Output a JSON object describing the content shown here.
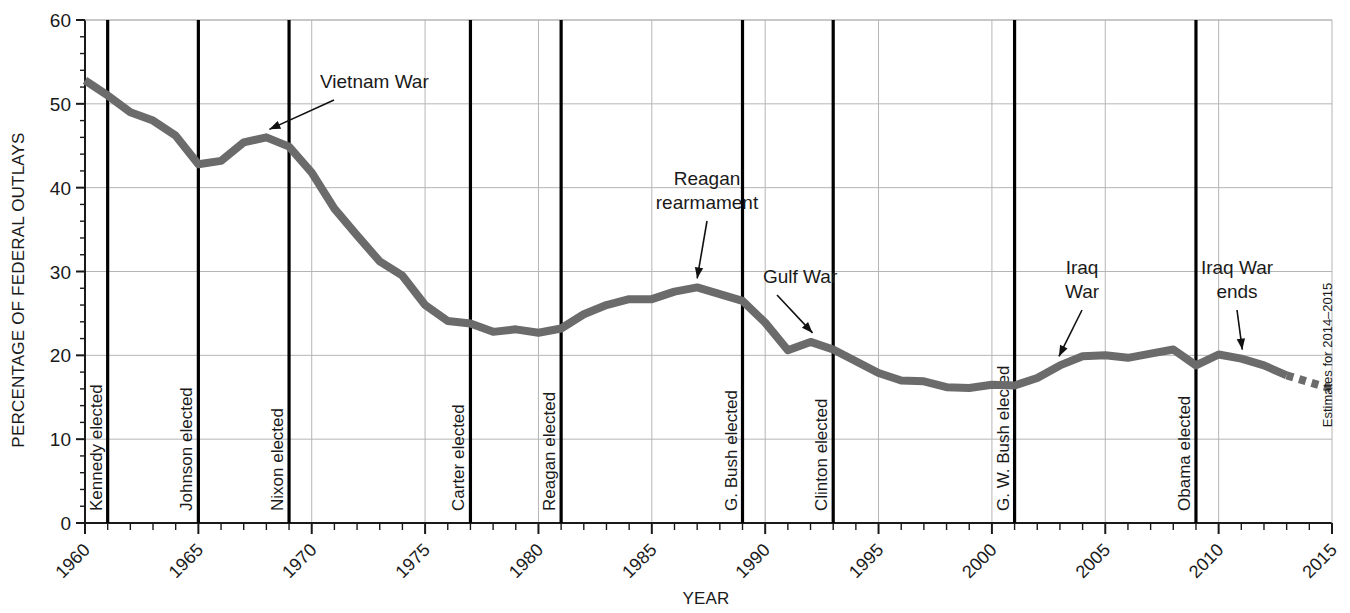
{
  "chart_data": {
    "type": "line",
    "title": "",
    "xlabel": "YEAR",
    "ylabel": "PERCENTAGE OF FEDERAL OUTLAYS",
    "xlim": [
      1960,
      2015
    ],
    "ylim": [
      0,
      60
    ],
    "y_ticks": [
      0,
      10,
      20,
      30,
      40,
      50,
      60
    ],
    "y_minor_tick_step": 2,
    "x_ticks": [
      1960,
      1965,
      1970,
      1975,
      1980,
      1985,
      1990,
      1995,
      2000,
      2005,
      2010,
      2015
    ],
    "x_minor_tick_step": 1,
    "grid": "horizontal major + vertical at labeled years",
    "legend": "none",
    "series": [
      {
        "name": "Defense share of federal outlays",
        "color": "#6b6b6b",
        "x": [
          1960,
          1961,
          1962,
          1963,
          1964,
          1965,
          1966,
          1967,
          1968,
          1969,
          1970,
          1971,
          1972,
          1973,
          1974,
          1975,
          1976,
          1977,
          1978,
          1979,
          1980,
          1981,
          1982,
          1983,
          1984,
          1985,
          1986,
          1987,
          1988,
          1989,
          1990,
          1991,
          1992,
          1993,
          1994,
          1995,
          1996,
          1997,
          1998,
          1999,
          2000,
          2001,
          2002,
          2003,
          2004,
          2005,
          2006,
          2007,
          2008,
          2009,
          2010,
          2011,
          2012,
          2013
        ],
        "values": [
          52.8,
          51.0,
          49.0,
          48.0,
          46.2,
          42.8,
          43.2,
          45.4,
          46.0,
          44.9,
          41.8,
          37.5,
          34.3,
          31.2,
          29.5,
          26.0,
          24.1,
          23.8,
          22.8,
          23.1,
          22.7,
          23.2,
          24.9,
          26.0,
          26.7,
          26.7,
          27.6,
          28.1,
          27.3,
          26.5,
          23.9,
          20.6,
          21.6,
          20.7,
          19.3,
          17.9,
          17.0,
          16.9,
          16.2,
          16.1,
          16.5,
          16.4,
          17.3,
          18.8,
          19.9,
          20.0,
          19.7,
          20.2,
          20.7,
          18.8,
          20.1,
          19.6,
          18.8,
          17.6
        ],
        "projection_note": "Estimates for 2014–2015",
        "projection_style": "dashed continuation after 2013",
        "projection_x": [
          2013.5,
          2015
        ],
        "projection_values": [
          17.2,
          16.0
        ]
      }
    ],
    "election_markers": [
      {
        "label": "Kennedy elected",
        "year": 1961
      },
      {
        "label": "Johnson elected",
        "year": 1965
      },
      {
        "label": "Nixon elected",
        "year": 1969
      },
      {
        "label": "Carter elected",
        "year": 1977
      },
      {
        "label": "Reagan elected",
        "year": 1981
      },
      {
        "label": "G. Bush elected",
        "year": 1989
      },
      {
        "label": "Clinton elected",
        "year": 1993
      },
      {
        "label": "G. W. Bush elected",
        "year": 2001
      },
      {
        "label": "Obama elected",
        "year": 2009
      }
    ],
    "annotations": [
      {
        "text": "Vietnam War",
        "lines": [
          "Vietnam War"
        ],
        "target_year": 1968,
        "target_value": 46.0
      },
      {
        "text": "Reagan rearmament",
        "lines": [
          "Reagan",
          "rearmament"
        ],
        "target_year": 1987,
        "target_value": 28.1
      },
      {
        "text": "Gulf War",
        "lines": [
          "Gulf War"
        ],
        "target_year": 1992,
        "target_value": 21.6
      },
      {
        "text": "Iraq War",
        "lines": [
          "Iraq",
          "War"
        ],
        "target_year": 2003,
        "target_value": 18.8
      },
      {
        "text": "Iraq War ends",
        "lines": [
          "Iraq War",
          "ends"
        ],
        "target_year": 2011,
        "target_value": 19.6
      }
    ],
    "side_note": "Estimates for 2014–2015"
  },
  "axis": {
    "y_title": "PERCENTAGE OF FEDERAL OUTLAYS",
    "x_title": "YEAR",
    "y_tick_labels": [
      "0",
      "10",
      "20",
      "30",
      "40",
      "50",
      "60"
    ],
    "x_tick_labels": [
      "1960",
      "1965",
      "1970",
      "1975",
      "1980",
      "1985",
      "1990",
      "1995",
      "2000",
      "2005",
      "2010",
      "2015"
    ]
  },
  "style": {
    "line_color": "#6b6b6b",
    "grid_color": "#b5b5b5",
    "axis_color": "#1a1a1a",
    "event_line_color": "#000000",
    "background": "#ffffff"
  }
}
